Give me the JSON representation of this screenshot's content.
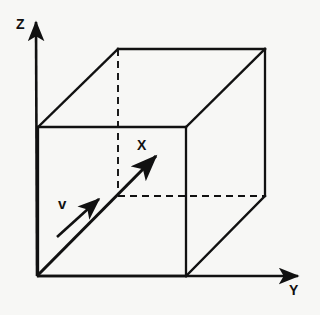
{
  "figure": {
    "background_color": "#f7f7f5",
    "line_color": "#111111"
  },
  "axes": {
    "z": {
      "label": "Z",
      "icon": "arrow-up-icon",
      "origin": [
        37,
        276
      ],
      "tip": [
        36,
        18
      ]
    },
    "y": {
      "label": "Y",
      "icon": "arrow-right-icon",
      "origin": [
        37,
        276
      ],
      "tip": [
        302,
        276
      ]
    }
  },
  "vectors": {
    "x": {
      "label": "X",
      "icon": "arrow-diagonal-icon",
      "start": [
        37,
        276
      ],
      "tip": [
        160,
        152
      ]
    },
    "v": {
      "label": "v",
      "icon": "arrow-diagonal-icon",
      "start": [
        58,
        236
      ],
      "tip": [
        102,
        196
      ]
    }
  },
  "cube": {
    "front_face": [
      [
        38,
        127
      ],
      [
        186,
        127
      ],
      [
        186,
        276
      ],
      [
        38,
        276
      ]
    ],
    "back_face": [
      [
        118,
        49
      ],
      [
        265,
        49
      ],
      [
        265,
        196
      ],
      [
        118,
        196
      ]
    ],
    "solid_edges": [
      [
        [
          38,
          127
        ],
        [
          186,
          127
        ]
      ],
      [
        [
          186,
          127
        ],
        [
          186,
          276
        ]
      ],
      [
        [
          38,
          276
        ],
        [
          186,
          276
        ]
      ],
      [
        [
          38,
          127
        ],
        [
          38,
          276
        ]
      ],
      [
        [
          118,
          49
        ],
        [
          265,
          49
        ]
      ],
      [
        [
          265,
          49
        ],
        [
          265,
          196
        ]
      ],
      [
        [
          38,
          127
        ],
        [
          118,
          49
        ]
      ],
      [
        [
          186,
          127
        ],
        [
          265,
          49
        ]
      ],
      [
        [
          186,
          276
        ],
        [
          265,
          196
        ]
      ]
    ],
    "hidden_edges": [
      [
        [
          118,
          49
        ],
        [
          118,
          196
        ]
      ],
      [
        [
          118,
          196
        ],
        [
          265,
          196
        ]
      ]
    ]
  }
}
